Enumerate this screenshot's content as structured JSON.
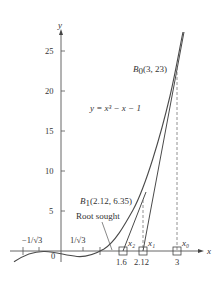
{
  "figure": {
    "equation_label": "y = x³ − x − 1",
    "axes": {
      "x_label": "x",
      "y_label": "y",
      "y_ticks": [
        {
          "value": 25,
          "label": "25"
        },
        {
          "value": 20,
          "label": "20"
        },
        {
          "value": 15,
          "label": "15"
        },
        {
          "value": 10,
          "label": "10"
        },
        {
          "value": 5,
          "label": "5"
        }
      ],
      "x_ticks": [
        {
          "value": -1,
          "label": "−1"
        },
        {
          "value": -0.577,
          "label": "−1/√3"
        },
        {
          "value": 0,
          "label": "0"
        },
        {
          "value": 0.577,
          "label": "1/√3"
        },
        {
          "value": 1,
          "label": "1"
        }
      ],
      "x_marked": [
        {
          "value": 1.6,
          "label": "1.6",
          "name": "x₂"
        },
        {
          "value": 2.12,
          "label": "2.12",
          "name": "x₁"
        },
        {
          "value": 3,
          "label": "3",
          "name": "x₀"
        }
      ],
      "xlim": [
        -1.2,
        3.7
      ],
      "ylim": [
        -2,
        28
      ]
    },
    "points": {
      "B0": {
        "label": "B",
        "sub": "0",
        "coords": "(3, 23)",
        "x": 3,
        "y": 23
      },
      "B1": {
        "label": "B",
        "sub": "1",
        "coords": "(2.12, 6.35)",
        "x": 2.12,
        "y": 6.35
      }
    },
    "annotations": {
      "root_sought": "Root sought",
      "neg_inv_sqrt3": "−1/√3",
      "inv_sqrt3": "1/√3",
      "zero": "0"
    },
    "colors": {
      "curve": "#4a4a4a",
      "axis": "#555555",
      "text": "#333333",
      "dashed": "#777777"
    }
  }
}
